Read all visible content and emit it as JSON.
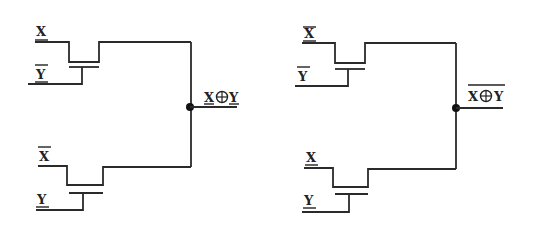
{
  "diagram": {
    "type": "circuit",
    "circuits": [
      {
        "id": "xor",
        "output_label": "X⊕Y",
        "output_overline": false,
        "transistors": [
          {
            "source_label": "X",
            "source_overline": false,
            "gate_label": "Y",
            "gate_overline": true
          },
          {
            "source_label": "X",
            "source_overline": true,
            "gate_label": "Y",
            "gate_overline": false
          }
        ]
      },
      {
        "id": "xnor",
        "output_label": "X⊕Y",
        "output_overline": true,
        "transistors": [
          {
            "source_label": "X",
            "source_overline": true,
            "gate_label": "Y",
            "gate_overline": true
          },
          {
            "source_label": "X",
            "source_overline": false,
            "gate_label": "Y",
            "gate_overline": false
          }
        ]
      }
    ],
    "labels": {
      "x": "X",
      "y": "Y",
      "out_x": "X",
      "out_op": "⊕",
      "out_y": "Y"
    },
    "colors": {
      "wire": "#2a2a2a",
      "background": "#ffffff"
    }
  }
}
